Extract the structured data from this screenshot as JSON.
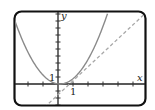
{
  "chart_data": {
    "type": "line",
    "title": "",
    "xlabel": "x",
    "ylabel": "y",
    "x_tick_label": "1",
    "y_tick_label": "1",
    "grid": false,
    "legend": null,
    "xlim": [
      -3,
      6
    ],
    "ylim": [
      -3,
      10.5
    ],
    "series": [
      {
        "name": "parabola",
        "style": "solid",
        "color": "#8a8a8a",
        "equation": "y = x^2",
        "x": [
          -3,
          -2,
          -1,
          0,
          1,
          2,
          3
        ],
        "y": [
          9,
          4,
          1,
          0,
          1,
          4,
          9
        ]
      },
      {
        "name": "tangent line",
        "style": "dashed",
        "color": "#a0a0a0",
        "equation": "y = 2x - 1",
        "x": [
          -1,
          0,
          1,
          2,
          3,
          5.5
        ],
        "y": [
          -3,
          -1,
          1,
          3,
          5,
          10
        ]
      }
    ]
  },
  "frame": {
    "border_color": "#111111",
    "curve_color": "#8a8a8a",
    "dash_color": "#a8a8a8"
  }
}
